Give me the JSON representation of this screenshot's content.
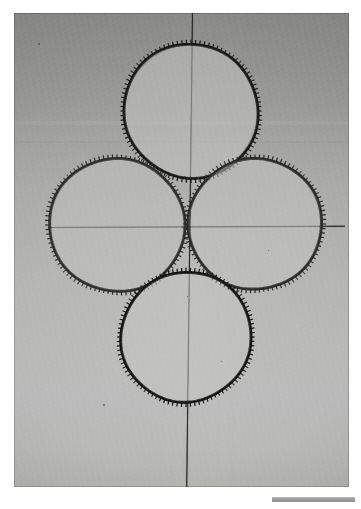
{
  "image": {
    "kind": "scanned-photograph",
    "subject": "four toothed rings arranged in a quatrefoil around crosshair reference lines",
    "background_color": "#ffffff",
    "print_border": {
      "left": 14,
      "top": 13,
      "width": 335,
      "height": 474
    }
  },
  "paper": {
    "tone_top_hex": "#8e8e8c",
    "tone_mid_hex": "#b3b3b1",
    "tone_bottom_hex": "#b9b9b7",
    "description": "grey photographic print, darker at top, lighter toward the lower half"
  },
  "reference_lines": {
    "horizontal": {
      "label": "horizontal-axis-line",
      "color_hex": "#2a2a28",
      "x_start": 48,
      "x_end": 345,
      "y": 227
    },
    "vertical": {
      "label": "vertical-axis-line",
      "color_hex": "#2a2a28",
      "x_top": 192,
      "x_bottom": 186,
      "y_start": 13,
      "y_end": 487
    },
    "intersection": {
      "x": 189,
      "y": 228
    }
  },
  "rings": [
    {
      "name": "top-ring",
      "position": "top",
      "center_x": 191,
      "center_y": 111,
      "radius": 67,
      "teeth_count": 96,
      "tooth_side": "outward",
      "stroke_hex": "#171716",
      "interior_hex": "#c2c2c0"
    },
    {
      "name": "left-ring",
      "position": "left",
      "center_x": 117,
      "center_y": 225,
      "radius": 67,
      "teeth_count": 96,
      "tooth_side": "outward",
      "stroke_hex": "#2d2d2b",
      "interior_hex": "#bfbfbd"
    },
    {
      "name": "right-ring",
      "position": "right",
      "center_x": 255,
      "center_y": 224,
      "radius": 66,
      "teeth_count": 96,
      "tooth_side": "outward",
      "stroke_hex": "#2a2a28",
      "interior_hex": "#c1c1bf"
    },
    {
      "name": "bottom-ring",
      "position": "bottom",
      "center_x": 186,
      "center_y": 337,
      "radius": 65,
      "teeth_count": 96,
      "tooth_side": "outward",
      "stroke_hex": "#131312",
      "interior_hex": "#c4c4c2"
    }
  ],
  "blemishes": [
    {
      "name": "speck-upper-left",
      "x": 38,
      "y": 43,
      "size": 2
    },
    {
      "name": "speck-lower-left",
      "x": 103,
      "y": 404,
      "size": 2
    },
    {
      "name": "speck-center",
      "x": 187,
      "y": 296,
      "size": 1
    },
    {
      "name": "speck-right",
      "x": 268,
      "y": 250,
      "size": 1
    },
    {
      "name": "speck-bottom-right",
      "x": 221,
      "y": 361,
      "size": 1
    }
  ],
  "scale_bar": {
    "name": "scale-bar",
    "x": 272,
    "y": 497,
    "width": 83,
    "height": 5,
    "color_hex": "#9f9f9f"
  }
}
